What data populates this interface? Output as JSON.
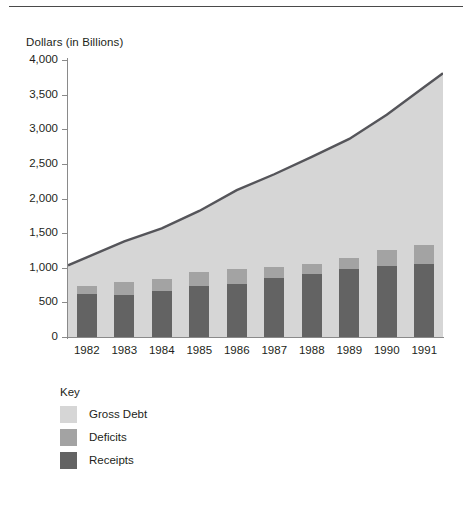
{
  "figure": {
    "y_axis_title": "Dollars (in Billions)",
    "top_rule": true
  },
  "legend": {
    "title": "Key",
    "entries": [
      {
        "label": "Gross Debt",
        "color": "#d6d6d6"
      },
      {
        "label": "Deficits",
        "color": "#a3a3a3"
      },
      {
        "label": "Receipts",
        "color": "#636363"
      }
    ]
  },
  "chart_data": {
    "type": "area",
    "title": "",
    "xlabel": "",
    "ylabel": "Dollars (in Billions)",
    "ylim": [
      0,
      4000
    ],
    "yticks": [
      0,
      500,
      1000,
      1500,
      2000,
      2500,
      3000,
      3500,
      4000
    ],
    "ytick_labels": [
      "0",
      "500",
      "1,000",
      "1,500",
      "2,000",
      "2,500",
      "3,000",
      "3,500",
      "4,000"
    ],
    "grid": false,
    "legend_position": "below-plot-left",
    "categories": [
      "1982",
      "1983",
      "1984",
      "1985",
      "1986",
      "1987",
      "1988",
      "1989",
      "1990",
      "1991"
    ],
    "series": [
      {
        "name": "Gross Debt",
        "kind": "area",
        "color": "#d6d6d6",
        "edge_color": "#55555a",
        "values": [
          1150,
          1380,
          1570,
          1820,
          2120,
          2350,
          2600,
          2860,
          3210,
          3610
        ]
      },
      {
        "name": "Deficits",
        "kind": "bar-segment",
        "color": "#a3a3a3",
        "values": [
          110,
          195,
          175,
          210,
          215,
          150,
          150,
          150,
          220,
          270
        ]
      },
      {
        "name": "Receipts",
        "kind": "bar-segment",
        "color": "#636363",
        "values": [
          620,
          600,
          665,
          730,
          770,
          855,
          910,
          985,
          1030,
          1060
        ]
      }
    ],
    "bar_totals": [
      730,
      795,
      840,
      940,
      985,
      1005,
      1060,
      1135,
      1250,
      1330
    ]
  }
}
